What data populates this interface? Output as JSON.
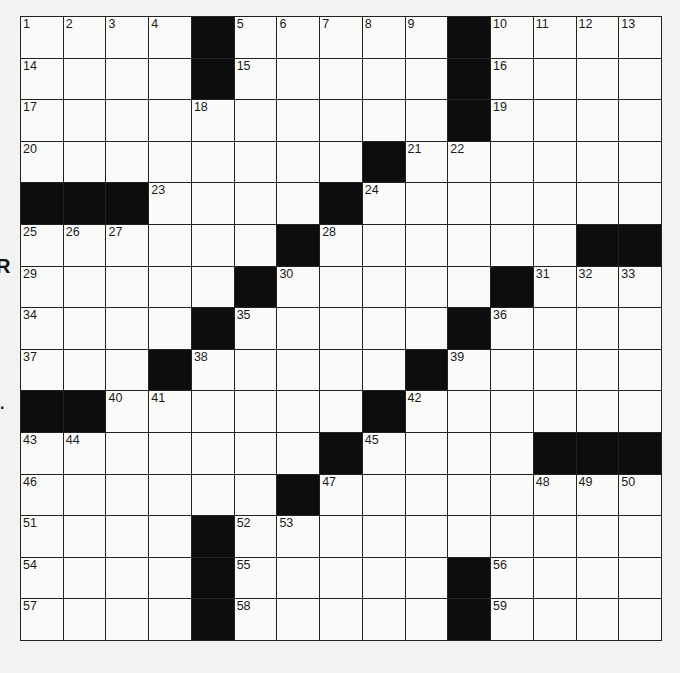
{
  "puzzle": {
    "rows": 15,
    "cols": 15,
    "colors": {
      "background": "#f2f2f0",
      "cell": "#fafaf8",
      "block": "#0d0d0d",
      "gridline": "#222222",
      "number": "#1a1a1a"
    },
    "blocks": [
      [
        0,
        4
      ],
      [
        0,
        10
      ],
      [
        1,
        4
      ],
      [
        1,
        10
      ],
      [
        2,
        10
      ],
      [
        3,
        8
      ],
      [
        4,
        0
      ],
      [
        4,
        1
      ],
      [
        4,
        2
      ],
      [
        4,
        7
      ],
      [
        5,
        6
      ],
      [
        5,
        13
      ],
      [
        5,
        14
      ],
      [
        6,
        5
      ],
      [
        6,
        11
      ],
      [
        7,
        4
      ],
      [
        7,
        10
      ],
      [
        8,
        3
      ],
      [
        8,
        9
      ],
      [
        9,
        0
      ],
      [
        9,
        1
      ],
      [
        9,
        8
      ],
      [
        10,
        7
      ],
      [
        10,
        12
      ],
      [
        10,
        13
      ],
      [
        10,
        14
      ],
      [
        11,
        6
      ],
      [
        12,
        4
      ],
      [
        13,
        4
      ],
      [
        13,
        10
      ],
      [
        14,
        4
      ],
      [
        14,
        10
      ]
    ],
    "numbers": [
      {
        "r": 0,
        "c": 0,
        "n": "1"
      },
      {
        "r": 0,
        "c": 1,
        "n": "2"
      },
      {
        "r": 0,
        "c": 2,
        "n": "3"
      },
      {
        "r": 0,
        "c": 3,
        "n": "4"
      },
      {
        "r": 0,
        "c": 5,
        "n": "5"
      },
      {
        "r": 0,
        "c": 6,
        "n": "6"
      },
      {
        "r": 0,
        "c": 7,
        "n": "7"
      },
      {
        "r": 0,
        "c": 8,
        "n": "8"
      },
      {
        "r": 0,
        "c": 9,
        "n": "9"
      },
      {
        "r": 0,
        "c": 11,
        "n": "10"
      },
      {
        "r": 0,
        "c": 12,
        "n": "11"
      },
      {
        "r": 0,
        "c": 13,
        "n": "12"
      },
      {
        "r": 0,
        "c": 14,
        "n": "13"
      },
      {
        "r": 1,
        "c": 0,
        "n": "14"
      },
      {
        "r": 1,
        "c": 5,
        "n": "15"
      },
      {
        "r": 1,
        "c": 11,
        "n": "16"
      },
      {
        "r": 2,
        "c": 0,
        "n": "17"
      },
      {
        "r": 2,
        "c": 4,
        "n": "18"
      },
      {
        "r": 2,
        "c": 11,
        "n": "19"
      },
      {
        "r": 3,
        "c": 0,
        "n": "20"
      },
      {
        "r": 3,
        "c": 9,
        "n": "21"
      },
      {
        "r": 3,
        "c": 10,
        "n": "22"
      },
      {
        "r": 4,
        "c": 3,
        "n": "23"
      },
      {
        "r": 4,
        "c": 8,
        "n": "24"
      },
      {
        "r": 5,
        "c": 0,
        "n": "25"
      },
      {
        "r": 5,
        "c": 1,
        "n": "26"
      },
      {
        "r": 5,
        "c": 2,
        "n": "27"
      },
      {
        "r": 5,
        "c": 7,
        "n": "28"
      },
      {
        "r": 6,
        "c": 0,
        "n": "29"
      },
      {
        "r": 6,
        "c": 6,
        "n": "30"
      },
      {
        "r": 6,
        "c": 12,
        "n": "31"
      },
      {
        "r": 6,
        "c": 13,
        "n": "32"
      },
      {
        "r": 6,
        "c": 14,
        "n": "33"
      },
      {
        "r": 7,
        "c": 0,
        "n": "34"
      },
      {
        "r": 7,
        "c": 5,
        "n": "35"
      },
      {
        "r": 7,
        "c": 11,
        "n": "36"
      },
      {
        "r": 8,
        "c": 0,
        "n": "37"
      },
      {
        "r": 8,
        "c": 4,
        "n": "38"
      },
      {
        "r": 8,
        "c": 10,
        "n": "39"
      },
      {
        "r": 9,
        "c": 2,
        "n": "40"
      },
      {
        "r": 9,
        "c": 3,
        "n": "41"
      },
      {
        "r": 9,
        "c": 9,
        "n": "42"
      },
      {
        "r": 10,
        "c": 0,
        "n": "43"
      },
      {
        "r": 10,
        "c": 1,
        "n": "44"
      },
      {
        "r": 10,
        "c": 8,
        "n": "45"
      },
      {
        "r": 11,
        "c": 0,
        "n": "46"
      },
      {
        "r": 11,
        "c": 7,
        "n": "47"
      },
      {
        "r": 11,
        "c": 12,
        "n": "48"
      },
      {
        "r": 11,
        "c": 13,
        "n": "49"
      },
      {
        "r": 11,
        "c": 14,
        "n": "50"
      },
      {
        "r": 12,
        "c": 0,
        "n": "51"
      },
      {
        "r": 12,
        "c": 5,
        "n": "52"
      },
      {
        "r": 12,
        "c": 6,
        "n": "53"
      },
      {
        "r": 13,
        "c": 0,
        "n": "54"
      },
      {
        "r": 13,
        "c": 5,
        "n": "55"
      },
      {
        "r": 13,
        "c": 11,
        "n": "56"
      },
      {
        "r": 14,
        "c": 0,
        "n": "57"
      },
      {
        "r": 14,
        "c": 5,
        "n": "58"
      },
      {
        "r": 14,
        "c": 11,
        "n": "59"
      }
    ],
    "entries": {}
  },
  "margin": {
    "mark_top": "R",
    "mark_bottom": "."
  }
}
